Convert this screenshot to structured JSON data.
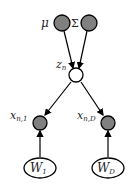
{
  "diagram": {
    "type": "graphical-model",
    "nodes": [
      {
        "id": "mu",
        "label": "μ",
        "kind": "observed",
        "shape": "circle"
      },
      {
        "id": "sigma",
        "label": "Σ",
        "kind": "observed",
        "shape": "circle"
      },
      {
        "id": "z",
        "label": "z",
        "subscript": "n",
        "kind": "latent",
        "shape": "circle"
      },
      {
        "id": "x1",
        "label": "x",
        "subscript": "n,1",
        "kind": "observed",
        "shape": "circle"
      },
      {
        "id": "xD",
        "label": "x",
        "subscript": "n,D",
        "kind": "observed",
        "shape": "circle"
      },
      {
        "id": "W1",
        "label": "W",
        "subscript": "1",
        "kind": "parameter",
        "shape": "ellipse"
      },
      {
        "id": "WD",
        "label": "W",
        "subscript": "D",
        "kind": "parameter",
        "shape": "ellipse"
      }
    ],
    "edges": [
      {
        "from": "mu",
        "to": "z"
      },
      {
        "from": "sigma",
        "to": "z"
      },
      {
        "from": "z",
        "to": "x1"
      },
      {
        "from": "z",
        "to": "xD"
      },
      {
        "from": "W1",
        "to": "x1"
      },
      {
        "from": "WD",
        "to": "xD"
      }
    ],
    "colors": {
      "observed_fill": "#808080",
      "latent_fill": "#ffffff",
      "stroke": "#000000"
    }
  }
}
